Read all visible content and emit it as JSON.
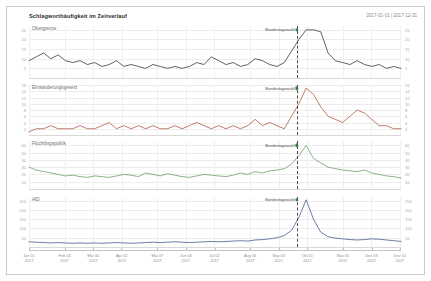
{
  "header": {
    "title": "Schlagworthäufigkeit im Zeitverlauf",
    "date_range": "2017-01-01 | 2017-12-31"
  },
  "annotation": {
    "label": "Bundestagswahl",
    "date": "2017-09-24",
    "x_fraction": 0.7205,
    "line_style": "dashed",
    "line_color": "#4a4a4a"
  },
  "chart_data": {
    "type": "line",
    "title": "Schlagworthäufigkeit im Zeitverlauf",
    "subtitle": "2017-01-01 | 2017-12-31",
    "xlabel": "",
    "ylabel": "",
    "grid": true,
    "legend": "none",
    "layout": "4 stacked small-multiple panels, shared weekly x-axis, dual y-axis labels (left and right)",
    "x_range": [
      "2017-01-01",
      "2017-12-31"
    ],
    "x_tick_labels": [
      {
        "l1": "Jan 01",
        "l2": "2017",
        "pos": 0.0
      },
      {
        "l1": "Feb 05",
        "l2": "2017",
        "pos": 0.0959
      },
      {
        "l1": "Mär 05",
        "l2": "2017",
        "pos": 0.1726
      },
      {
        "l1": "Apr 02",
        "l2": "2017",
        "pos": 0.2493
      },
      {
        "l1": "Mai 07",
        "l2": "2017",
        "pos": 0.3452
      },
      {
        "l1": "Jun 04",
        "l2": "2017",
        "pos": 0.4219
      },
      {
        "l1": "Jul 02",
        "l2": "2017",
        "pos": 0.4986
      },
      {
        "l1": "Aug 06",
        "l2": "2017",
        "pos": 0.5945
      },
      {
        "l1": "Sep 03",
        "l2": "2017",
        "pos": 0.6712
      },
      {
        "l1": "Okt 01",
        "l2": "2017",
        "pos": 0.7479
      },
      {
        "l1": "Nov 05",
        "l2": "2017",
        "pos": 0.8438
      },
      {
        "l1": "Dez 03",
        "l2": "2017",
        "pos": 0.9205
      },
      {
        "l1": "Dez 31",
        "l2": "2017",
        "pos": 0.9972
      }
    ],
    "series": [
      {
        "name": "Obergrenze",
        "color": "#3a3a3a",
        "ylim": [
          0,
          27
        ],
        "y_ticks": [
          5,
          10,
          15,
          20,
          25
        ],
        "peak_value": 25,
        "peak_label": "Bundestagswahl",
        "values": [
          9,
          11,
          13,
          10,
          12,
          9,
          8,
          9,
          7,
          8,
          6,
          7,
          9,
          6,
          7,
          6,
          5,
          7,
          6,
          5,
          6,
          5,
          6,
          8,
          7,
          11,
          9,
          7,
          8,
          6,
          7,
          10,
          9,
          7,
          6,
          8,
          14,
          20,
          25,
          25,
          24,
          13,
          9,
          8,
          7,
          9,
          7,
          6,
          7,
          5,
          6,
          5
        ]
      },
      {
        "name": "Einwanderungsgesetz",
        "color": "#b05b48",
        "ylim": [
          0,
          16
        ],
        "y_ticks": [
          2,
          4,
          6,
          8,
          10,
          12,
          14,
          16
        ],
        "peak_value": 15,
        "peak_label": "Bundestagswahl",
        "values": [
          1,
          2,
          2,
          3,
          2,
          2,
          2,
          3,
          2,
          2,
          3,
          4,
          2,
          3,
          2,
          3,
          2,
          3,
          2,
          2,
          3,
          2,
          3,
          4,
          3,
          2,
          3,
          2,
          3,
          2,
          3,
          5,
          3,
          4,
          3,
          2,
          6,
          10,
          15,
          13,
          9,
          6,
          5,
          4,
          6,
          8,
          7,
          5,
          3,
          3,
          2,
          2
        ]
      },
      {
        "name": "Flüchtlingspolitik",
        "color": "#6f9e6a",
        "ylim": [
          0,
          66
        ],
        "y_ticks": [
          10,
          20,
          30,
          40,
          50,
          60
        ],
        "peak_value": 60,
        "peak_label": "Bundestagswahl",
        "values": [
          30,
          26,
          24,
          22,
          20,
          18,
          19,
          17,
          16,
          18,
          17,
          16,
          18,
          20,
          19,
          17,
          22,
          20,
          18,
          21,
          19,
          17,
          16,
          18,
          20,
          19,
          18,
          17,
          19,
          22,
          20,
          24,
          22,
          25,
          26,
          28,
          34,
          46,
          60,
          42,
          36,
          30,
          28,
          26,
          25,
          24,
          26,
          22,
          20,
          18,
          17,
          15
        ]
      },
      {
        "name": "AfD",
        "color": "#4a5a90",
        "ylim": [
          0,
          270
        ],
        "y_ticks": [
          50,
          100,
          150,
          200,
          250
        ],
        "peak_value": 255,
        "peak_label": "Bundestagswahl",
        "values": [
          28,
          26,
          24,
          22,
          24,
          22,
          20,
          22,
          20,
          22,
          20,
          22,
          24,
          22,
          20,
          22,
          24,
          26,
          24,
          26,
          28,
          26,
          24,
          26,
          28,
          30,
          28,
          30,
          32,
          34,
          32,
          38,
          40,
          44,
          50,
          62,
          90,
          160,
          255,
          150,
          80,
          56,
          48,
          44,
          40,
          38,
          40,
          44,
          42,
          38,
          34,
          30
        ]
      }
    ]
  }
}
